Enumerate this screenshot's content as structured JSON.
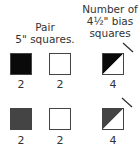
{
  "headers": {
    "pair": [
      "Pair",
      "5\" squares."
    ],
    "bias": [
      "Number of",
      "4½\" bias",
      "squares"
    ]
  },
  "rows": [
    {
      "squares": [
        {
          "type": "solid",
          "color": "#0a0a0a",
          "count": "2"
        },
        {
          "type": "solid",
          "color": "#ffffff",
          "count": "2"
        },
        {
          "type": "half-diagonal",
          "dark": "#0a0a0a",
          "light": "#ffffff",
          "count": "4"
        }
      ]
    },
    {
      "squares": [
        {
          "type": "solid",
          "color": "#444444",
          "count": "2"
        },
        {
          "type": "solid",
          "color": "#ffffff",
          "count": "2"
        },
        {
          "type": "half-diagonal",
          "dark": "#444444",
          "light": "#ffffff",
          "count": "4"
        }
      ]
    }
  ]
}
